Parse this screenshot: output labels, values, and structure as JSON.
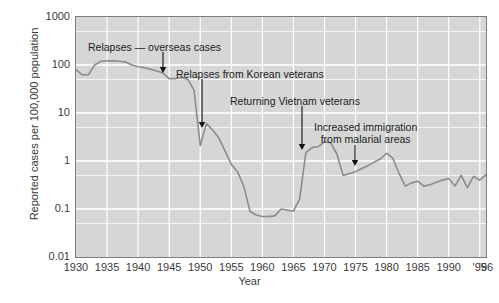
{
  "chart_data": {
    "type": "line",
    "title": "",
    "xlabel": "Year",
    "ylabel": "Reported cases per 100,000 population",
    "yscale": "log",
    "ylim": [
      0.01,
      1000
    ],
    "xlim": [
      1930,
      1996
    ],
    "grid": true,
    "legend": "none",
    "line_color": "#8c8c8c",
    "plot_background": "#d6d6d6",
    "gridline_color": "#ffffff",
    "ytick_labels": [
      "1000",
      "100",
      "10",
      "1",
      "0.1",
      "0.01"
    ],
    "ytick_values": [
      1000,
      100,
      10,
      1,
      0.1,
      0.01
    ],
    "xtick_labels": [
      "1930",
      "1935",
      "1940",
      "1945",
      "1950",
      "1955",
      "1960",
      "1965",
      "1970",
      "1975",
      "1980",
      "1985",
      "1990",
      "'95",
      "'96"
    ],
    "xtick_values": [
      1930,
      1935,
      1940,
      1945,
      1950,
      1955,
      1960,
      1965,
      1970,
      1975,
      1980,
      1985,
      1990,
      1995,
      1996
    ],
    "series": [
      {
        "name": "Reported malaria cases",
        "x": [
          1930,
          1931,
          1932,
          1933,
          1934,
          1935,
          1936,
          1937,
          1938,
          1939,
          1940,
          1941,
          1942,
          1943,
          1944,
          1945,
          1946,
          1947,
          1948,
          1949,
          1950,
          1951,
          1952,
          1953,
          1954,
          1955,
          1956,
          1957,
          1958,
          1959,
          1960,
          1961,
          1962,
          1963,
          1964,
          1965,
          1966,
          1967,
          1968,
          1969,
          1970,
          1971,
          1972,
          1973,
          1974,
          1975,
          1976,
          1977,
          1978,
          1979,
          1980,
          1981,
          1982,
          1983,
          1984,
          1985,
          1986,
          1987,
          1988,
          1989,
          1990,
          1991,
          1992,
          1993,
          1994,
          1995,
          1996
        ],
        "y": [
          80,
          62,
          63,
          100,
          120,
          122,
          122,
          120,
          115,
          100,
          92,
          88,
          82,
          75,
          68,
          52,
          52,
          55,
          50,
          30,
          2.1,
          6.0,
          4.4,
          3.0,
          1.6,
          0.85,
          0.6,
          0.3,
          0.09,
          0.075,
          0.07,
          0.07,
          0.072,
          0.1,
          0.095,
          0.09,
          0.16,
          1.5,
          1.9,
          2.0,
          2.5,
          2.4,
          1.4,
          0.5,
          0.55,
          0.6,
          0.7,
          0.8,
          0.95,
          1.1,
          1.45,
          1.15,
          0.55,
          0.3,
          0.35,
          0.38,
          0.3,
          0.32,
          0.36,
          0.4,
          0.43,
          0.3,
          0.5,
          0.28,
          0.48,
          0.4,
          0.52
        ]
      }
    ],
    "annotations": [
      {
        "id": "relapses-overseas",
        "text": "Relapses — overseas cases",
        "text_x": 88,
        "text_y": 41,
        "arrow_x": 163,
        "arrow_y0": 52,
        "arrow_y1": 73
      },
      {
        "id": "korean-veterans",
        "text": "Relapses from Korean veterans",
        "text_x": 176,
        "text_y": 68,
        "arrow_x": 202,
        "arrow_y0": 79,
        "arrow_y1": 128
      },
      {
        "id": "vietnam-veterans",
        "text": "Returning Vietnam veterans",
        "text_x": 230,
        "text_y": 95,
        "arrow_x": 302,
        "arrow_y0": 106,
        "arrow_y1": 150
      },
      {
        "id": "malarial-immigration",
        "text_line1": "Increased immigration",
        "text_line2": "from malarial areas",
        "text_x": 314,
        "text_y": 121,
        "arrow_x": 355,
        "arrow_y0": 145,
        "arrow_y1": 166
      }
    ]
  }
}
